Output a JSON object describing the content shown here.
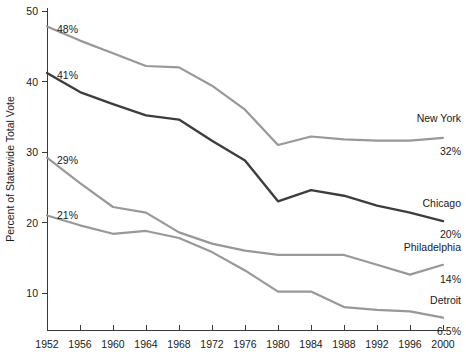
{
  "chart_data": {
    "type": "line",
    "title": "",
    "xlabel": "",
    "ylabel": "Percent of Statewide Total Vote",
    "xlim": [
      1952,
      2000
    ],
    "ylim": [
      5,
      50
    ],
    "yticks": [
      10,
      20,
      30,
      40,
      50
    ],
    "ytick_labels": [
      "10",
      "20",
      "30",
      "40",
      "50"
    ],
    "x": [
      1952,
      1956,
      1960,
      1964,
      1968,
      1972,
      1976,
      1980,
      1984,
      1988,
      1992,
      1996,
      2000
    ],
    "xtick_labels": [
      "1952",
      "1956",
      "1960",
      "1964",
      "1968",
      "1972",
      "1976",
      "1980",
      "1984",
      "1988",
      "1992",
      "1996",
      "2000"
    ],
    "grid": false,
    "legend_position": "right-inline",
    "series": [
      {
        "name": "New York",
        "color": "#989898",
        "width": 2.2,
        "start_label": "48%",
        "end_label": "32%",
        "values": [
          47.8,
          45.8,
          44.0,
          42.2,
          42.0,
          39.4,
          36.0,
          31.0,
          32.2,
          31.8,
          31.6,
          31.6,
          32.0
        ]
      },
      {
        "name": "Chicago",
        "color": "#3d3d3d",
        "width": 2.4,
        "start_label": "41%",
        "end_label": "20%",
        "values": [
          41.2,
          38.5,
          36.8,
          35.2,
          34.6,
          31.6,
          28.8,
          23.0,
          24.6,
          23.8,
          22.4,
          21.4,
          20.2
        ]
      },
      {
        "name": "Philadelphia",
        "color": "#989898",
        "width": 2.2,
        "start_label": "29%",
        "end_label": "14%",
        "values": [
          29.2,
          25.6,
          22.2,
          21.4,
          18.6,
          17.0,
          16.0,
          15.4,
          15.4,
          15.4,
          14.0,
          12.6,
          14.0
        ]
      },
      {
        "name": "Detroit",
        "color": "#989898",
        "width": 2.2,
        "start_label": "21%",
        "end_label": "6.5%",
        "values": [
          21.0,
          19.6,
          18.4,
          18.8,
          17.8,
          15.8,
          13.2,
          10.2,
          10.2,
          8.0,
          7.6,
          7.4,
          6.5
        ]
      }
    ]
  },
  "annotations": {
    "start_labels": [
      {
        "text": "48%",
        "series": "New York"
      },
      {
        "text": "41%",
        "series": "Chicago"
      },
      {
        "text": "29%",
        "series": "Philadelphia"
      },
      {
        "text": "21%",
        "series": "Detroit"
      }
    ],
    "end_labels": [
      {
        "text": "32%",
        "series": "New York"
      },
      {
        "text": "20%",
        "series": "Chicago"
      },
      {
        "text": "14%",
        "series": "Philadelphia"
      },
      {
        "text": "6.5%",
        "series": "Detroit"
      }
    ],
    "series_names": [
      "New York",
      "Chicago",
      "Philadelphia",
      "Detroit"
    ]
  },
  "axis": {
    "y_title": "Percent of Statewide Total Vote",
    "axis_color": "#3a3a3a"
  }
}
